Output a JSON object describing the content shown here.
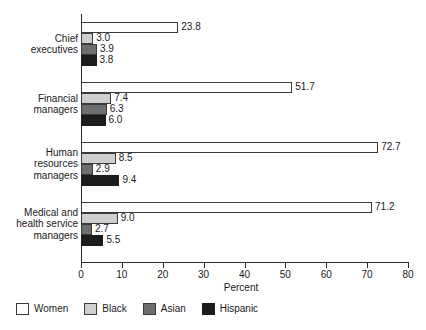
{
  "chart_data": {
    "type": "bar",
    "orientation": "horizontal",
    "title": "",
    "xlabel": "Percent",
    "ylabel": "",
    "xlim": [
      0,
      80
    ],
    "xticks": [
      0,
      10,
      20,
      30,
      40,
      50,
      60,
      70,
      80
    ],
    "grid": false,
    "legend_position": "bottom-left",
    "categories": [
      "Chief\nexecutives",
      "Financial\nmanagers",
      "Human\nresources\nmanagers",
      "Medical and\nhealth service\nmanagers"
    ],
    "series": [
      {
        "name": "Women",
        "color": "#fdfdfd",
        "values": [
          23.8,
          51.7,
          72.7,
          71.2
        ]
      },
      {
        "name": "Black",
        "color": "#cfcfcf",
        "values": [
          3.0,
          7.4,
          8.5,
          9.0
        ]
      },
      {
        "name": "Asian",
        "color": "#6e6e6e",
        "values": [
          3.9,
          6.3,
          2.9,
          2.7
        ]
      },
      {
        "name": "Hispanic",
        "color": "#1c1c1c",
        "values": [
          3.8,
          6.0,
          9.4,
          5.5
        ]
      }
    ],
    "value_labels": [
      [
        "23.8",
        "3.0",
        "3.9",
        "3.8"
      ],
      [
        "51.7",
        "7.4",
        "6.3",
        "6.0"
      ],
      [
        "72.7",
        "8.5",
        "2.9",
        "9.4"
      ],
      [
        "71.2",
        "9.0",
        "2.7",
        "5.5"
      ]
    ],
    "tick_labels": [
      "0",
      "10",
      "20",
      "30",
      "40",
      "50",
      "60",
      "70",
      "80"
    ]
  },
  "axis": {
    "x_title": "Percent"
  },
  "legend": {
    "items": [
      {
        "label": "Women"
      },
      {
        "label": "Black"
      },
      {
        "label": "Asian"
      },
      {
        "label": "Hispanic"
      }
    ]
  }
}
